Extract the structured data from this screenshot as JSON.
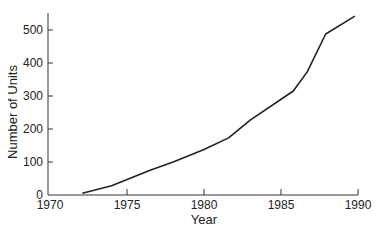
{
  "chart_data": {
    "type": "line",
    "title": "",
    "xlabel": "Year",
    "ylabel": "Number of Units",
    "xlim": [
      1970,
      1990
    ],
    "ylim": [
      0,
      550
    ],
    "x_ticks": [
      1970,
      1975,
      1980,
      1985,
      1990
    ],
    "y_ticks": [
      0,
      100,
      200,
      300,
      400,
      500
    ],
    "grid": false,
    "legend": null,
    "series": [
      {
        "name": "Number of Units",
        "color": "#222222",
        "points": [
          [
            1972.1,
            5
          ],
          [
            1974.0,
            28
          ],
          [
            1976.5,
            75
          ],
          [
            1978.0,
            100
          ],
          [
            1980.0,
            138
          ],
          [
            1981.6,
            173
          ],
          [
            1983.0,
            227
          ],
          [
            1985.8,
            315
          ],
          [
            1986.7,
            373
          ],
          [
            1987.9,
            488
          ],
          [
            1989.8,
            542
          ]
        ]
      }
    ]
  }
}
